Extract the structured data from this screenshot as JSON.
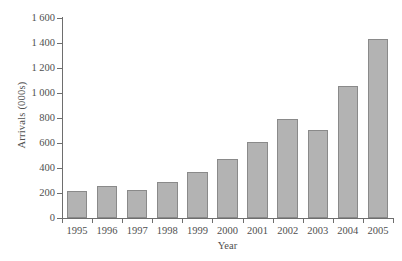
{
  "chart_data": {
    "type": "bar",
    "title": "",
    "xlabel": "Year",
    "ylabel": "Arrivals (000s)",
    "categories": [
      "1995",
      "1996",
      "1997",
      "1998",
      "1999",
      "2000",
      "2001",
      "2002",
      "2003",
      "2004",
      "2005"
    ],
    "values": [
      220,
      255,
      222,
      285,
      370,
      470,
      610,
      790,
      705,
      1060,
      1435
    ],
    "ylim": [
      0,
      1600
    ],
    "xlim_note": "categorical",
    "y_ticks": [
      0,
      200,
      400,
      600,
      800,
      1000,
      1200,
      1400,
      1600
    ],
    "y_tick_labels": [
      "0",
      "200",
      "400",
      "600",
      "800",
      "1 000",
      "1 200",
      "1 400",
      "1 600"
    ],
    "grid": false,
    "legend": "none",
    "series": [
      {
        "name": "Arrivals",
        "values": [
          220,
          255,
          222,
          285,
          370,
          470,
          610,
          790,
          705,
          1060,
          1435
        ]
      }
    ],
    "colors": {
      "bar_fill": "#b3b3b3",
      "bar_border": "#8a8a8a",
      "axis": "#6e6e6e",
      "text": "#4f4f4f",
      "background": "#ffffff"
    }
  }
}
